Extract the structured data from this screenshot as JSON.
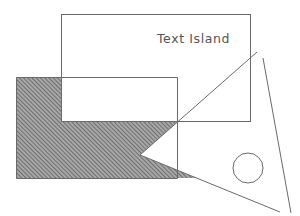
{
  "diagram": {
    "title": "",
    "colors": {
      "background": "#ffffff",
      "stroke": "#6a6a6a",
      "hatch_fill": "#9a9a9a",
      "hatch_line": "#555555",
      "text": "#555555"
    },
    "text_island": {
      "label": "Text Island",
      "rect": {
        "x": 61,
        "y": 14,
        "width": 189,
        "height": 107
      },
      "text_x": 157,
      "text_y": 43
    },
    "hatched_region": {
      "outer_rect": {
        "x": 16,
        "y": 77,
        "width": 161,
        "height": 101
      },
      "pattern": "diagonal-hatch"
    },
    "triangle": {
      "points": [
        [
          257,
          52
        ],
        [
          140,
          155
        ],
        [
          280,
          212
        ]
      ]
    },
    "line": {
      "from": [
        263,
        58
      ],
      "to": [
        291,
        213
      ]
    },
    "circle": {
      "cx": 248,
      "cy": 168,
      "r": 15
    }
  }
}
